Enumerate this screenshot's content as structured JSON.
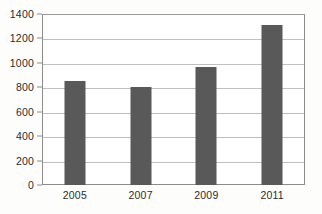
{
  "chart_data": {
    "type": "bar",
    "title": "",
    "subtitle": "",
    "xlabel": "",
    "ylabel": "",
    "categories": [
      "2005",
      "2007",
      "2009",
      "2011"
    ],
    "values": [
      855,
      800,
      970,
      1310
    ],
    "series": [
      {
        "name": "",
        "values": [
          855,
          800,
          970,
          1310
        ]
      }
    ],
    "ylim": [
      0,
      1400
    ],
    "yticks": [
      0,
      200,
      400,
      600,
      800,
      1000,
      1200,
      1400
    ],
    "ytick_labels": [
      "0",
      "200",
      "400",
      "600",
      "800",
      "1000",
      "1200",
      "1400"
    ],
    "grid": true,
    "legend": false,
    "legend_position": "none",
    "annotations": [],
    "colors": {
      "bar": "#595959",
      "gridline": "#bfbfbf",
      "axis": "#8c8c8c",
      "text": "#2b2b2b",
      "plot_background": "#ffffff",
      "figure_background": "#fdfdfc"
    }
  }
}
